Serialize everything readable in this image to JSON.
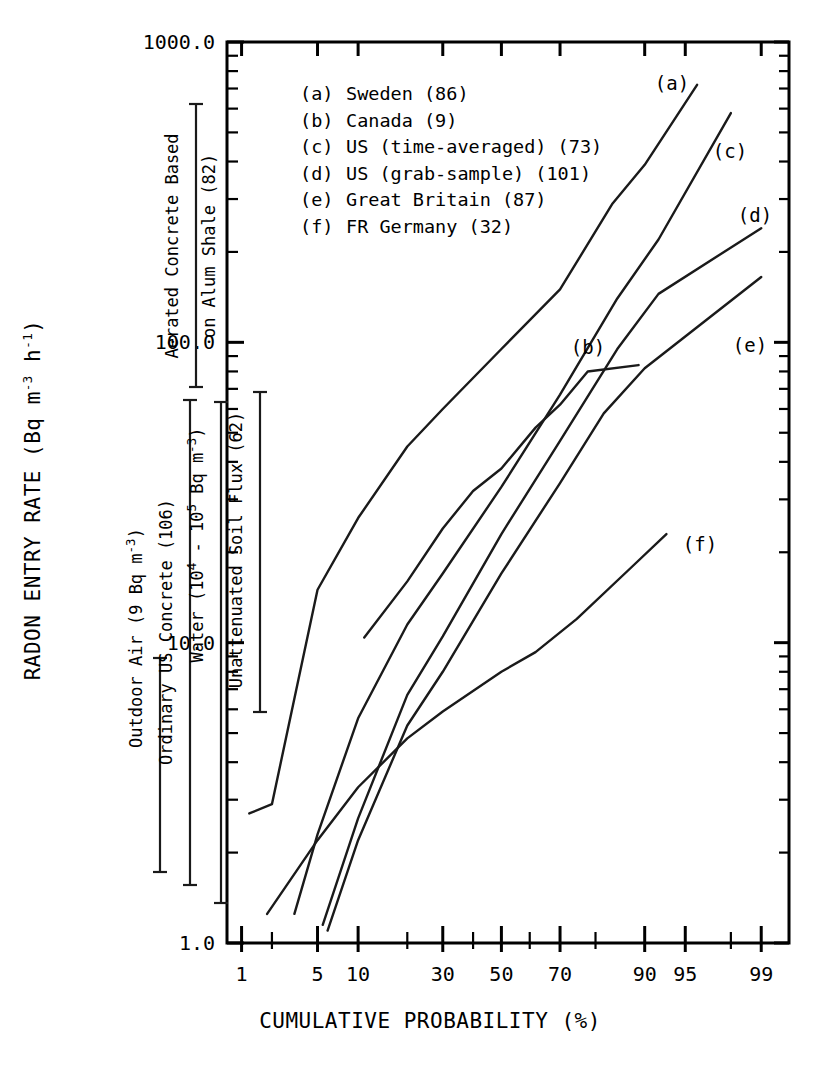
{
  "figure": {
    "title": "",
    "background": "#ffffff",
    "ink_color": "#000000"
  },
  "axes": {
    "y": {
      "label": "RADON ENTRY RATE (Bq m",
      "label_sup1": "-3",
      "label_mid": " h",
      "label_sup2": "-1",
      "label_end": ")",
      "label_plain": "RADON ENTRY RATE (Bq m-3 h-1)",
      "scale": "log",
      "ticks": [
        "1000.0",
        "100.0",
        "10.0",
        "1.0"
      ],
      "tick_values": [
        1000,
        100,
        10,
        1
      ],
      "range": [
        1,
        1000
      ]
    },
    "x": {
      "label": "CUMULATIVE PROBABILITY (%)",
      "scale": "probability",
      "ticks": [
        "1",
        "5",
        "10",
        "30",
        "50",
        "70",
        "90",
        "95",
        "99"
      ],
      "tick_values": [
        1,
        5,
        10,
        30,
        50,
        70,
        90,
        95,
        99
      ],
      "minor_tick_values": [
        2,
        20,
        40,
        60,
        80,
        98
      ],
      "range": [
        0.7,
        99.5
      ]
    }
  },
  "legend": {
    "position": "top-left-inside",
    "entries": [
      {
        "key": "(a)",
        "label": "Sweden (86)",
        "country": "Sweden",
        "count": 86
      },
      {
        "key": "(b)",
        "label": "Canada (9)",
        "country": "Canada",
        "count": 9
      },
      {
        "key": "(c)",
        "label": "US (time-averaged) (73)",
        "country": "US (time-averaged)",
        "count": 73
      },
      {
        "key": "(d)",
        "label": "US (grab-sample) (101)",
        "country": "US (grab-sample)",
        "count": 101
      },
      {
        "key": "(e)",
        "label": "Great Britain (87)",
        "country": "Great Britain",
        "count": 87
      },
      {
        "key": "(f)",
        "label": "FR Germany (32)",
        "country": "FR Germany",
        "count": 32
      }
    ]
  },
  "curve_labels": [
    {
      "key": "(a)",
      "x": 672,
      "y": 90
    },
    {
      "key": "(b)",
      "x": 588,
      "y": 354
    },
    {
      "key": "(c)",
      "x": 730,
      "y": 158
    },
    {
      "key": "(d)",
      "x": 755,
      "y": 222
    },
    {
      "key": "(e)",
      "x": 750,
      "y": 352
    },
    {
      "key": "(f)",
      "x": 700,
      "y": 551
    }
  ],
  "annotations": [
    {
      "id": "aerated-concrete",
      "text": "Aerated Concrete Based on Alum Shale (82)",
      "line1": "Aerated Concrete Based",
      "line2": "on Alum Shale (82)",
      "value_count": 82,
      "bar_x": 196,
      "bar_top": 104,
      "bar_bottom": 387,
      "text_x_line1": 178,
      "text_x_line2": 215
    },
    {
      "id": "outdoor-air",
      "text": "Outdoor Air (9 Bq m-3)",
      "text_main": "Outdoor Air (9 Bq m",
      "text_sup": "-3",
      "text_tail": ")",
      "bar_x": 160,
      "bar_top": 658,
      "bar_bottom": 872,
      "text_x": 142
    },
    {
      "id": "ordinary-us-concrete",
      "text": "Ordinary US Concrete (106)",
      "value_count": 106,
      "bar_x": 190,
      "bar_top": 400,
      "bar_bottom": 885,
      "text_x": 172
    },
    {
      "id": "water",
      "text": "Water (104 - 105 Bq m-3)",
      "text_a": "Water (10",
      "text_sup_a": "4",
      "text_b": " - 10",
      "text_sup_b": "5",
      "text_c": " Bq m",
      "text_sup_c": "-3",
      "text_d": ")",
      "bar_x": 221,
      "bar_top": 402,
      "bar_bottom": 903,
      "text_x": 203
    },
    {
      "id": "unattenuated-soil-flux",
      "text": "Unattenuated Soil Flux (62)",
      "value_count": 62,
      "bar_x": 260,
      "bar_top": 392,
      "bar_bottom": 712,
      "text_x": 242
    }
  ],
  "chart_data": {
    "type": "line",
    "title": "",
    "subtitle": "",
    "xlabel": "CUMULATIVE PROBABILITY (%)",
    "ylabel": "RADON ENTRY RATE (Bq m-3 h-1)",
    "xscale": "probability",
    "yscale": "log",
    "xlim": [
      0.7,
      99.5
    ],
    "ylim": [
      1.0,
      1000.0
    ],
    "xticks": [
      1,
      5,
      10,
      30,
      50,
      70,
      90,
      95,
      99
    ],
    "xtick_labels": [
      "1",
      "5",
      "10",
      "30",
      "50",
      "70",
      "90",
      "95",
      "99"
    ],
    "yticks": [
      1.0,
      10.0,
      100.0,
      1000.0
    ],
    "ytick_labels": [
      "1.0",
      "10.0",
      "100.0",
      "1000.0"
    ],
    "grid": false,
    "legend_position": "upper-left-inside",
    "series": [
      {
        "name": "Sweden (86)",
        "key": "(a)",
        "x": [
          1.2,
          2.0,
          5.0,
          10.0,
          20.0,
          30.0,
          50.0,
          70.0,
          84.0,
          90.0,
          96.0
        ],
        "y": [
          2.7,
          2.9,
          15.0,
          26.0,
          45.0,
          60.0,
          95.0,
          150.0,
          290.0,
          390.0,
          720.0
        ]
      },
      {
        "name": "Canada (9)",
        "key": "(b)",
        "x": [
          11.0,
          20.0,
          30.0,
          40.0,
          50.0,
          62.0,
          70.0,
          78.0,
          89.0
        ],
        "y": [
          10.4,
          16.0,
          24.0,
          32.0,
          38.0,
          52.0,
          62.0,
          80.0,
          84.0
        ]
      },
      {
        "name": "US (time-averaged) (73)",
        "key": "(c)",
        "x": [
          3.2,
          5.0,
          10.0,
          20.0,
          30.0,
          50.0,
          70.0,
          85.0,
          92.0,
          98.0
        ],
        "y": [
          1.25,
          2.3,
          5.6,
          11.5,
          17.0,
          33.0,
          67.0,
          140.0,
          220.0,
          580.0
        ]
      },
      {
        "name": "US (grab-sample) (101)",
        "key": "(d)",
        "x": [
          5.5,
          10.0,
          20.0,
          30.0,
          50.0,
          70.0,
          85.0,
          92.0,
          99.0
        ],
        "y": [
          1.15,
          2.6,
          6.7,
          10.5,
          23.0,
          47.0,
          95.0,
          145.0,
          240.0
        ]
      },
      {
        "name": "Great Britain (87)",
        "key": "(e)",
        "x": [
          6.0,
          10.0,
          20.0,
          30.0,
          50.0,
          70.0,
          82.0,
          90.0,
          99.0
        ],
        "y": [
          1.1,
          2.2,
          5.3,
          8.0,
          17.0,
          34.0,
          58.0,
          82.0,
          165.0
        ]
      },
      {
        "name": "FR Germany (32)",
        "key": "(f)",
        "x": [
          1.8,
          5.0,
          10.0,
          20.0,
          30.0,
          50.0,
          62.0,
          75.0,
          88.0,
          93.0
        ],
        "y": [
          1.25,
          2.2,
          3.3,
          4.8,
          5.9,
          8.0,
          9.3,
          12.0,
          18.0,
          23.0
        ]
      }
    ]
  }
}
